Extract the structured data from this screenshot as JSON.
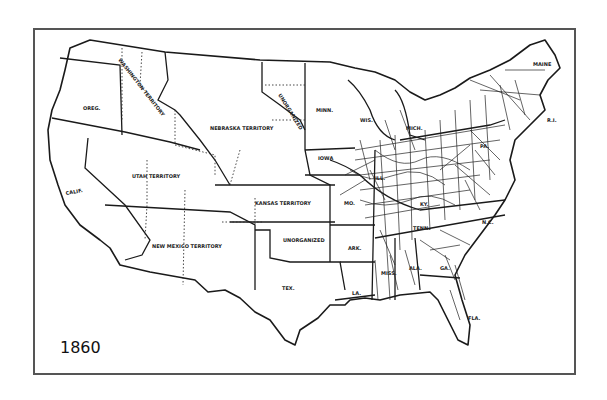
{
  "map": {
    "year": "1860",
    "subject": "United States railroads and territories",
    "colors": {
      "line": "#1a1a1a",
      "frame": "#555555",
      "background": "#ffffff"
    },
    "labels": {
      "oreg": "OREG.",
      "washington_territory": "WASHINGTON TERRITORY",
      "calif": "CALIF.",
      "utah_territory": "UTAH TERRITORY",
      "nebraska_territory": "NEBRASKA TERRITORY",
      "unorganized_north": "UNORGANIZED",
      "minn": "MINN.",
      "wis": "WIS.",
      "mich": "MICH.",
      "iowa": "IOWA",
      "kansas_territory": "KANSAS TERRITORY",
      "new_mexico_territory": "NEW MEXICO TERRITORY",
      "unorganized_south": "UNORGANIZED",
      "mo": "MO.",
      "ark": "ARK.",
      "tex": "TEX.",
      "la": "LA.",
      "miss": "MISS.",
      "ala": "ALA.",
      "ga": "GA.",
      "fla": "FLA.",
      "tenn": "TENN.",
      "ky": "KY.",
      "ill": "ILL.",
      "pa": "PA.",
      "n_c": "N.C.",
      "maine": "MAINE",
      "r_i": "R.I."
    }
  }
}
